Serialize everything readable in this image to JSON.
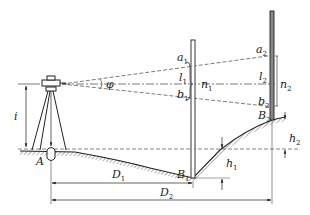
{
  "diagram": {
    "type": "surveying-stadia-leveling",
    "labels": {
      "angle": "φ",
      "instrument_height": "i",
      "point_a": "A",
      "rod1_top": {
        "base": "a",
        "sub": "1"
      },
      "rod1_mid": {
        "base": "l",
        "sub": "1"
      },
      "rod1_bot": {
        "base": "b",
        "sub": "1"
      },
      "rod1_interval": {
        "base": "n",
        "sub": "1"
      },
      "rod1_foot": {
        "base": "B",
        "sub": "1"
      },
      "rod1_height": {
        "base": "h",
        "sub": "1"
      },
      "rod2_top": {
        "base": "a",
        "sub": "2"
      },
      "rod2_mid": {
        "base": "l",
        "sub": "2"
      },
      "rod2_bot": {
        "base": "b",
        "sub": "2"
      },
      "rod2_interval": {
        "base": "n",
        "sub": "2"
      },
      "rod2_foot": {
        "base": "B",
        "sub": "2"
      },
      "rod2_height": {
        "base": "h",
        "sub": "2"
      },
      "distance1": {
        "base": "D",
        "sub": "1"
      },
      "distance2": {
        "base": "D",
        "sub": "2"
      }
    }
  }
}
